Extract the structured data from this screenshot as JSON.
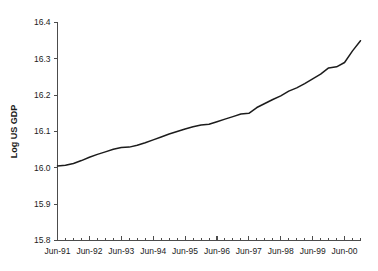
{
  "chart_data": {
    "type": "line",
    "title": "",
    "xlabel": "",
    "ylabel": "Log US GDP",
    "ylim": [
      15.8,
      16.4
    ],
    "ytick_labels": [
      "15.8",
      "15.9",
      "16.0",
      "16.1",
      "16.2",
      "16.3",
      "16.4"
    ],
    "ytick_values": [
      15.8,
      15.9,
      16.0,
      16.1,
      16.2,
      16.3,
      16.4
    ],
    "xtick_labels": [
      "Jun-91",
      "Jun-92",
      "Jun-93",
      "Jun-94",
      "Jun-95",
      "Jun-96",
      "Jun-97",
      "Jun-98",
      "Jun-99",
      "Jun-00"
    ],
    "xtick_values": [
      1991.5,
      1992.5,
      1993.5,
      1994.5,
      1995.5,
      1996.5,
      1997.5,
      1998.5,
      1999.5,
      2000.5
    ],
    "xlim": [
      1991.5,
      2001.0
    ],
    "grid": false,
    "legend": null,
    "legend_position": "none",
    "minor_tick_interval_years": 0.25,
    "series": [
      {
        "name": "Log US GDP",
        "color": "#1c1c1c",
        "x": [
          1991.5,
          1991.75,
          1992.0,
          1992.25,
          1992.5,
          1992.75,
          1993.0,
          1993.25,
          1993.5,
          1993.75,
          1994.0,
          1994.25,
          1994.5,
          1994.75,
          1995.0,
          1995.25,
          1995.5,
          1995.75,
          1996.0,
          1996.25,
          1996.5,
          1996.75,
          1997.0,
          1997.25,
          1997.5,
          1997.75,
          1998.0,
          1998.25,
          1998.5,
          1998.75,
          1999.0,
          1999.25,
          1999.5,
          1999.75,
          2000.0,
          2000.25,
          2000.5,
          2000.75,
          2001.0
        ],
        "values": [
          16.005,
          16.007,
          16.012,
          16.02,
          16.029,
          16.037,
          16.044,
          16.051,
          16.056,
          16.057,
          16.062,
          16.069,
          16.077,
          16.085,
          16.093,
          16.1,
          16.107,
          16.113,
          16.118,
          16.12,
          16.127,
          16.134,
          16.141,
          16.148,
          16.15,
          16.166,
          16.177,
          16.188,
          16.198,
          16.211,
          16.22,
          16.232,
          16.245,
          16.258,
          16.275,
          16.278,
          16.29,
          16.322,
          16.35
        ]
      }
    ],
    "axis_color": "#4c4c4c",
    "background_color": "#ffffff"
  }
}
